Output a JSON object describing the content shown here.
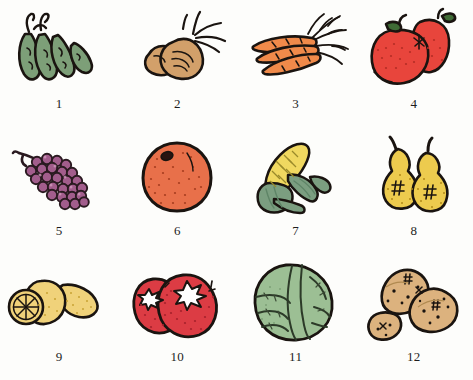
{
  "page": {
    "background_color": "#fdfdfb",
    "caption_color": "#1d1d1d",
    "outline_color": "#1a1410",
    "columns": 4,
    "rows": 3,
    "item_count": 12
  },
  "items": [
    {
      "number": "1",
      "name": "peas",
      "icon": "pea-pods-illustration",
      "fill": "#7d9f78",
      "shade": "#5f8560",
      "accent": "#1a1410"
    },
    {
      "number": "2",
      "name": "beets",
      "icon": "beets-illustration",
      "fill": "#d2a06a",
      "shade": "#b9854f",
      "accent": "#1a1410"
    },
    {
      "number": "3",
      "name": "carrots",
      "icon": "carrots-illustration",
      "fill": "#f08a4a",
      "shade": "#d9702f",
      "accent": "#1a1410"
    },
    {
      "number": "4",
      "name": "apples",
      "icon": "apples-illustration",
      "fill": "#e8453c",
      "shade": "#c9302c",
      "accent": "#3f6b35"
    },
    {
      "number": "5",
      "name": "grapes",
      "icon": "grapes-illustration",
      "fill": "#a25d8c",
      "shade": "#7d4268",
      "accent": "#2a1a20"
    },
    {
      "number": "6",
      "name": "orange",
      "icon": "orange-illustration",
      "fill": "#e8704a",
      "shade": "#cf5733",
      "accent": "#1a1410"
    },
    {
      "number": "7",
      "name": "corn",
      "icon": "corn-cob-illustration",
      "fill": "#f0d860",
      "shade": "#7b9e80",
      "accent": "#5f8567"
    },
    {
      "number": "8",
      "name": "pears",
      "icon": "pears-illustration",
      "fill": "#edcb4e",
      "shade": "#d7af33",
      "accent": "#1a1410"
    },
    {
      "number": "9",
      "name": "lemons",
      "icon": "lemons-illustration",
      "fill": "#f0d27a",
      "shade": "#e0bc56",
      "accent": "#1a1410"
    },
    {
      "number": "10",
      "name": "tomatoes",
      "icon": "tomatoes-illustration",
      "fill": "#dc3c44",
      "shade": "#bc2a33",
      "accent": "#ffffff"
    },
    {
      "number": "11",
      "name": "cabbage",
      "icon": "cabbage-illustration",
      "fill": "#9cbf94",
      "shade": "#7da176",
      "accent": "#2c3a28"
    },
    {
      "number": "12",
      "name": "potatoes",
      "icon": "potatoes-illustration",
      "fill": "#dcb27e",
      "shade": "#c4955f",
      "accent": "#1a1410"
    }
  ]
}
